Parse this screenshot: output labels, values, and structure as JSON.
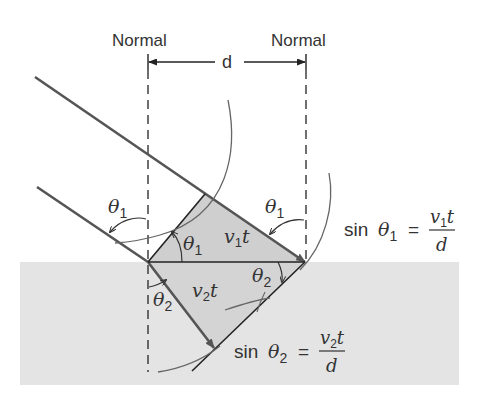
{
  "labels": {
    "normal_left": "Normal",
    "normal_right": "Normal",
    "distance": "d",
    "theta1_incident_left": "θ",
    "theta1_incident_left_sub": "1",
    "theta1_inner": "θ",
    "theta1_inner_sub": "1",
    "theta1_right": "θ",
    "theta1_right_sub": "1",
    "theta2_right": "θ",
    "theta2_right_sub": "2",
    "theta2_refracted": "θ",
    "theta2_refracted_sub": "2",
    "v1t_v": "v",
    "v1t_sub": "1",
    "v1t_t": "t",
    "v2t_v": "v",
    "v2t_sub": "2",
    "v2t_t": "t"
  },
  "equations": {
    "eq1": {
      "lhs": "sin",
      "theta": "θ",
      "theta_sub": "1",
      "equals": "=",
      "num_v": "v",
      "num_sub": "1",
      "num_t": "t",
      "den": "d"
    },
    "eq2": {
      "lhs": "sin",
      "theta": "θ",
      "theta_sub": "2",
      "equals": "=",
      "num_v": "v",
      "num_sub": "2",
      "num_t": "t",
      "den": "d"
    }
  },
  "colors": {
    "medium_fill": "#e4e4e4",
    "triangle_fill": "#cfcfcf",
    "ray": "#555555",
    "line": "#222222"
  }
}
